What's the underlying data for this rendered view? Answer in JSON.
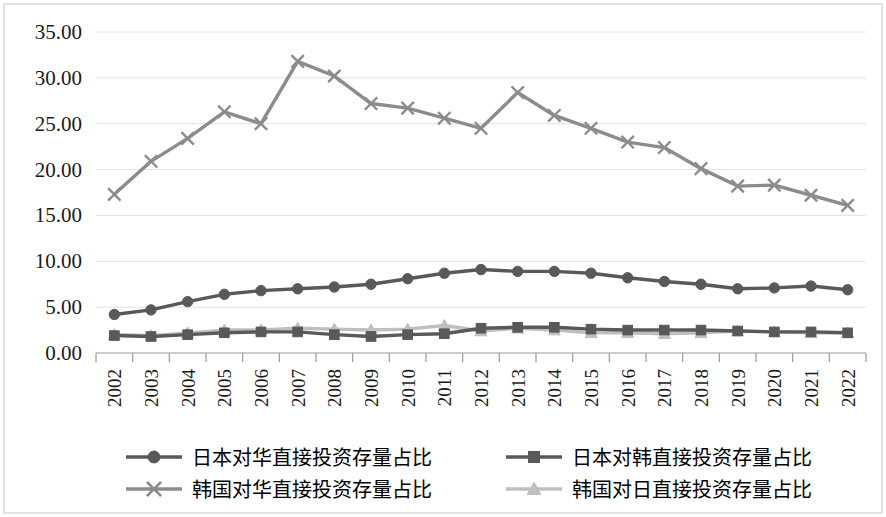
{
  "chart_data": {
    "type": "line",
    "title": "",
    "xlabel": "",
    "ylabel": "",
    "categories": [
      "2002",
      "2003",
      "2004",
      "2005",
      "2006",
      "2007",
      "2008",
      "2009",
      "2010",
      "2011",
      "2012",
      "2013",
      "2014",
      "2015",
      "2016",
      "2017",
      "2018",
      "2019",
      "2020",
      "2021",
      "2022"
    ],
    "ylim": [
      0,
      35
    ],
    "ytick_labels": [
      "0.00",
      "5.00",
      "10.00",
      "15.00",
      "20.00",
      "25.00",
      "30.00",
      "35.00"
    ],
    "ytick_values": [
      0,
      5,
      10,
      15,
      20,
      25,
      30,
      35
    ],
    "grid": true,
    "legend_position": "bottom",
    "series": [
      {
        "name": "日本对华直接投资存量占比",
        "marker": "circle",
        "color": "#595959",
        "values": [
          4.2,
          4.7,
          5.6,
          6.4,
          6.8,
          7.0,
          7.2,
          7.5,
          8.1,
          8.7,
          9.1,
          8.9,
          8.9,
          8.7,
          8.2,
          7.8,
          7.5,
          7.0,
          7.1,
          7.3,
          6.9
        ]
      },
      {
        "name": "日本对韩直接投资存量占比",
        "marker": "square",
        "color": "#595959",
        "values": [
          1.9,
          1.8,
          2.0,
          2.2,
          2.3,
          2.3,
          2.0,
          1.8,
          2.0,
          2.1,
          2.7,
          2.8,
          2.8,
          2.6,
          2.5,
          2.5,
          2.5,
          2.4,
          2.3,
          2.3,
          2.2
        ]
      },
      {
        "name": "韩国对华直接投资存量占比",
        "marker": "x",
        "color": "#8c8c8c",
        "values": [
          17.3,
          20.9,
          23.4,
          26.3,
          25.0,
          31.8,
          30.2,
          27.2,
          26.7,
          25.6,
          24.5,
          28.4,
          25.9,
          24.5,
          23.0,
          22.4,
          20.1,
          18.2,
          18.3,
          17.2,
          16.1
        ]
      },
      {
        "name": "韩国对日直接投资存量占比",
        "marker": "triangle",
        "color": "#bfbfbf",
        "values": [
          2.0,
          1.9,
          2.2,
          2.5,
          2.5,
          2.7,
          2.6,
          2.5,
          2.6,
          3.0,
          2.4,
          2.7,
          2.5,
          2.2,
          2.2,
          2.1,
          2.2,
          2.4,
          2.3,
          2.2,
          2.2
        ]
      }
    ]
  },
  "legend": {
    "items": [
      {
        "label": "日本对华直接投资存量占比",
        "marker": "circle",
        "color": "#595959"
      },
      {
        "label": "日本对韩直接投资存量占比",
        "marker": "square",
        "color": "#595959"
      },
      {
        "label": "韩国对华直接投资存量占比",
        "marker": "x",
        "color": "#8c8c8c"
      },
      {
        "label": "韩国对日直接投资存量占比",
        "marker": "triangle",
        "color": "#bfbfbf"
      }
    ]
  },
  "colors": {
    "gridline": "#e2e2e4",
    "axis": "#9a9a9a",
    "border": "#d9d9d9",
    "text": "#1a1a1a",
    "background": "#ffffff"
  }
}
